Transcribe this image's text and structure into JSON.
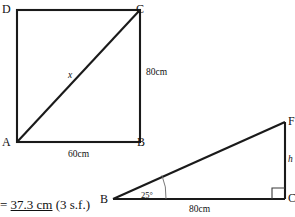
{
  "figure_square": {
    "name": "rectangle-ABCD-with-diagonal",
    "vertices": {
      "top_left": "D",
      "top_right": "C",
      "bottom_left": "A",
      "bottom_right": "B"
    },
    "dimensions": {
      "right_side": "80cm",
      "bottom_side": "60cm"
    },
    "diagonal_label": "x"
  },
  "figure_triangle": {
    "name": "right-triangle-BCF",
    "vertices": {
      "bottom_left": "B",
      "top_right": "F",
      "bottom_right": "C"
    },
    "dimensions": {
      "base": "80cm",
      "vertical_side": "h"
    },
    "angle_at_B": "25°",
    "right_angle_at": "C"
  },
  "answer": {
    "equals_sign": "= ",
    "value": "37.3 cm",
    "precision_note": " (3 s.f.)"
  },
  "colors": {
    "stroke": "#1a1a1a",
    "background": "#ffffff",
    "text": "#111111",
    "thin_stroke": "#555555"
  }
}
